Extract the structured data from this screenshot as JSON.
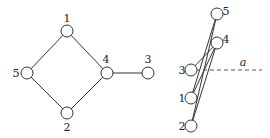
{
  "diagram": {
    "left_graph": {
      "nodes": [
        {
          "id": "1",
          "label": "1",
          "x": 67,
          "y": 31,
          "lx": 67,
          "ly": 22
        },
        {
          "id": "5",
          "label": "5",
          "x": 27,
          "y": 73,
          "lx": 16,
          "ly": 77
        },
        {
          "id": "4",
          "label": "4",
          "x": 107,
          "y": 73,
          "lx": 106,
          "ly": 63
        },
        {
          "id": "3",
          "label": "3",
          "x": 148,
          "y": 73,
          "lx": 148,
          "ly": 63
        },
        {
          "id": "2",
          "label": "2",
          "x": 67,
          "y": 113,
          "lx": 67,
          "ly": 131
        }
      ],
      "edges": [
        [
          "1",
          "5"
        ],
        [
          "1",
          "4"
        ],
        [
          "5",
          "2"
        ],
        [
          "2",
          "4"
        ],
        [
          "4",
          "3"
        ]
      ]
    },
    "right_graph": {
      "nodes": [
        {
          "id": "5",
          "label": "5",
          "x": 217,
          "y": 14,
          "lx": 226,
          "ly": 15
        },
        {
          "id": "4",
          "label": "4",
          "x": 217,
          "y": 43,
          "lx": 226,
          "ly": 43
        },
        {
          "id": "3",
          "label": "3",
          "x": 191,
          "y": 70,
          "lx": 182,
          "ly": 74
        },
        {
          "id": "1",
          "label": "1",
          "x": 191,
          "y": 98,
          "lx": 182,
          "ly": 102
        },
        {
          "id": "2",
          "label": "2",
          "x": 191,
          "y": 126,
          "lx": 182,
          "ly": 130
        }
      ],
      "edges": [
        [
          "1",
          "5"
        ],
        [
          "1",
          "4"
        ],
        [
          "2",
          "5"
        ],
        [
          "2",
          "4"
        ],
        [
          "3",
          "4"
        ]
      ],
      "axis_line": {
        "label": "a",
        "x1": 196,
        "y1": 70,
        "x2": 262,
        "y2": 70,
        "lx": 243,
        "ly": 66
      }
    },
    "node_radius": 6
  }
}
